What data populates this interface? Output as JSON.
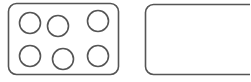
{
  "canvas": {
    "width": 250,
    "height": 82,
    "background_color": "#ffffff"
  },
  "style": {
    "stroke_color": "#555555",
    "stroke_width": 1.6,
    "fill_color": "#ffffff",
    "tile_corner_radius": 8,
    "pip_radius": 10.5
  },
  "tiles": [
    {
      "id": "tile-left",
      "name": "left-domino-tile",
      "pip_count": 6,
      "pip_count_label": "6",
      "clipped": false,
      "rect": {
        "x": 8.5,
        "y": 3.5,
        "width": 110,
        "height": 71,
        "rx": 8
      },
      "pips": [
        {
          "id": "pip-1",
          "name": "pip-top-left",
          "cx": 30,
          "cy": 23,
          "r": 10.5
        },
        {
          "id": "pip-2",
          "name": "pip-top-center",
          "cx": 58,
          "cy": 26,
          "r": 10.5
        },
        {
          "id": "pip-3",
          "name": "pip-top-right",
          "cx": 98,
          "cy": 21,
          "r": 10.5
        },
        {
          "id": "pip-4",
          "name": "pip-bottom-left",
          "cx": 30,
          "cy": 56,
          "r": 10.5
        },
        {
          "id": "pip-5",
          "name": "pip-bottom-center",
          "cx": 63,
          "cy": 59,
          "r": 10.5
        },
        {
          "id": "pip-6",
          "name": "pip-bottom-right",
          "cx": 98,
          "cy": 56,
          "r": 10.5
        }
      ]
    },
    {
      "id": "tile-right",
      "name": "right-domino-tile",
      "pip_count": 0,
      "pip_count_label": "0",
      "clipped": true,
      "rect": {
        "x": 145.5,
        "y": 4.5,
        "width": 112,
        "height": 70,
        "rx": 8
      },
      "pips": []
    }
  ]
}
